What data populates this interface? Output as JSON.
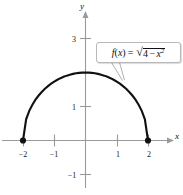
{
  "figure": {
    "background_color": "#ffffff",
    "curve_color": "#111111",
    "axis_color": "#9a9a9a",
    "callout_border_color": "#b8b8b8"
  },
  "axes": {
    "x_axis_label": "x",
    "y_axis_label": "y",
    "x_ticks": [
      {
        "value": -2,
        "label": "−2"
      },
      {
        "value": -1,
        "label": "−1"
      },
      {
        "value": 1,
        "label": "1"
      },
      {
        "value": 2,
        "label": "2"
      }
    ],
    "y_ticks": [
      {
        "value": 3,
        "label": "3"
      },
      {
        "value": 1,
        "label": "1"
      },
      {
        "value": -1,
        "label": "−1"
      }
    ]
  },
  "callout": {
    "function_prefix": "f",
    "arg_open": "(",
    "arg_var": "x",
    "arg_close": ")",
    "equals": "=",
    "radical_sign": "√",
    "radicand_lead": "4",
    "minus": "−",
    "radicand_var": "x",
    "exponent": "2",
    "full_text": "f(x) = √(4 − x²)"
  },
  "chart_data": {
    "type": "line",
    "title": "",
    "xlabel": "x",
    "ylabel": "y",
    "xlim": [
      -2.6,
      2.9
    ],
    "ylim": [
      -1.6,
      3.4
    ],
    "grid": false,
    "legend": null,
    "annotations": [
      {
        "text": "f(x) = √(4 − x²)",
        "x": 1.8,
        "y": 2.5,
        "points_to": {
          "x": 1.1,
          "y": 1.67
        }
      }
    ],
    "endpoints": [
      {
        "x": -2,
        "y": 0,
        "marker": "filled-circle"
      },
      {
        "x": 2,
        "y": 0,
        "marker": "filled-circle"
      }
    ],
    "series": [
      {
        "name": "f(x) = sqrt(4 - x^2)",
        "color": "#111111",
        "x": [
          -2.0,
          -1.9,
          -1.8,
          -1.7,
          -1.6,
          -1.5,
          -1.4,
          -1.3,
          -1.2,
          -1.1,
          -1.0,
          -0.9,
          -0.8,
          -0.7,
          -0.6,
          -0.5,
          -0.4,
          -0.3,
          -0.2,
          -0.1,
          0.0,
          0.1,
          0.2,
          0.3,
          0.4,
          0.5,
          0.6,
          0.7,
          0.8,
          0.9,
          1.0,
          1.1,
          1.2,
          1.3,
          1.4,
          1.5,
          1.6,
          1.7,
          1.8,
          1.9,
          2.0
        ],
        "y": [
          0.0,
          0.6245,
          0.8718,
          1.0536,
          1.2,
          1.3229,
          1.4283,
          1.5199,
          1.6,
          1.6703,
          1.7321,
          1.7861,
          1.833,
          1.8735,
          1.9079,
          1.9365,
          1.9596,
          1.9774,
          1.99,
          1.9975,
          2.0,
          1.9975,
          1.99,
          1.9774,
          1.9596,
          1.9365,
          1.9079,
          1.8735,
          1.833,
          1.7861,
          1.7321,
          1.6703,
          1.6,
          1.5199,
          1.4283,
          1.3229,
          1.2,
          1.0536,
          0.8718,
          0.6245,
          0.0
        ]
      }
    ]
  }
}
